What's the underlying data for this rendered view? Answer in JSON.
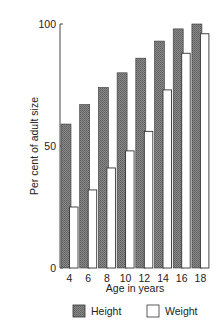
{
  "chart_data": {
    "type": "bar",
    "title": "",
    "xlabel": "Age in years",
    "ylabel": "Per cent of adult size",
    "ylim": [
      0,
      100
    ],
    "yticks": [
      0,
      50,
      100
    ],
    "categories": [
      "4",
      "6",
      "8",
      "10",
      "12",
      "14",
      "16",
      "18"
    ],
    "series": [
      {
        "name": "Height",
        "values": [
          59,
          67,
          74,
          80,
          86,
          93,
          98,
          100
        ],
        "fill": "#7a7a7a"
      },
      {
        "name": "Weight",
        "values": [
          25,
          32,
          41,
          48,
          56,
          73,
          88,
          96
        ],
        "fill": "#ffffff"
      }
    ],
    "grid": false,
    "legend_position": "bottom"
  },
  "legend": {
    "items": [
      {
        "label": "Height",
        "fill": "#7a7a7a"
      },
      {
        "label": "Weight",
        "fill": "#ffffff"
      }
    ]
  }
}
